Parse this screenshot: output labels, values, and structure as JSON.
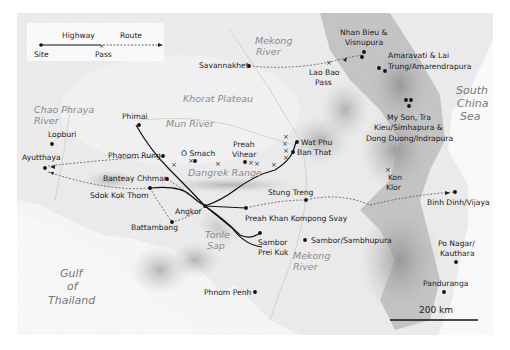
{
  "legend": {
    "highway_label": "Highway",
    "route_label": "Route",
    "site_label": "Site",
    "pass_label": "Pass"
  },
  "sites": [
    {
      "name": "Phimai",
      "x": 136,
      "y": 125
    },
    {
      "name": "Lopburi",
      "x": 52,
      "y": 144
    },
    {
      "name": "Ayutthaya",
      "x": 45,
      "y": 168
    },
    {
      "name": "Phanom Rung",
      "x": 163,
      "y": 156
    },
    {
      "name": "O Smach",
      "x": 195,
      "y": 161
    },
    {
      "name": "Preah Vihear",
      "x": 245,
      "y": 162
    },
    {
      "name": "Wat Phu",
      "x": 296,
      "y": 142
    },
    {
      "name": "Ban That",
      "x": 293,
      "y": 152
    },
    {
      "name": "Banteay Chhmar",
      "x": 167,
      "y": 179
    },
    {
      "name": "Sdok Kok Thom",
      "x": 150,
      "y": 188
    },
    {
      "name": "Battambang",
      "x": 172,
      "y": 222
    },
    {
      "name": "Angkor",
      "x": 205,
      "y": 206
    },
    {
      "name": "Preah Khan Kompong Svay",
      "x": 246,
      "y": 208
    },
    {
      "name": "Stung Treng",
      "x": 306,
      "y": 200
    },
    {
      "name": "Sambor Prei Kuk",
      "x": 260,
      "y": 233
    },
    {
      "name": "Sambor/Sambhupura",
      "x": 305,
      "y": 240
    },
    {
      "name": "Phnom Penh",
      "x": 255,
      "y": 292
    },
    {
      "name": "Savannakhet",
      "x": 249,
      "y": 66
    },
    {
      "name": "Nhan Bieu & Visnupura",
      "x": 364,
      "y": 52
    },
    {
      "name": "Amaravati & Lai Trung/Amarendrapura",
      "x": 383,
      "y": 70
    },
    {
      "name": "My Son, Tra Kieu/Simhapura & Dong Duong/Indrapura",
      "x": 408,
      "y": 103
    },
    {
      "name": "Binh Dinh/Vijaya",
      "x": 455,
      "y": 192
    },
    {
      "name": "Po Nagar/ Kauthara",
      "x": 456,
      "y": 262
    },
    {
      "name": "Panduranga",
      "x": 444,
      "y": 292
    }
  ],
  "labels": {
    "phimai": "Phimai",
    "lopburi": "Lopburi",
    "ayutthaya": "Ayutthaya",
    "phanom_rung": "Phanom Rung",
    "o_smach": "O Smach",
    "preah_vihear_1": "Preah",
    "preah_vihear_2": "Vihear",
    "wat_phu": "Wat Phu",
    "ban_that": "Ban That",
    "banteay_chhmar": "Banteay Chhmar",
    "sdok_kok_thom": "Sdok Kok Thom",
    "battambang": "Battambang",
    "angkor": "Angkor",
    "preah_khan": "Preah Khan Kompong Svay",
    "stung_treng": "Stung Treng",
    "sambor_prei_kuk_1": "Sambor",
    "sambor_prei_kuk_2": "Prei Kuk",
    "sambor_sambhupura": "Sambor/Sambhupura",
    "phnom_penh": "Phnom Penh",
    "savannakhet": "Savannakhet",
    "lao_bao_1": "Lao Bao",
    "lao_bao_2": "Pass",
    "nhan_bieu_1": "Nhan Bieu &",
    "nhan_bieu_2": "Visnupura",
    "amaravati_1": "Amaravati & Lai",
    "amaravati_2": "Trung/Amarendrapura",
    "myson_1": "My Son, Tra",
    "myson_2": "Kieu/Simhapura &",
    "myson_3": "Dong Duong/Indrapura",
    "kon_klor_1": "Kon",
    "kon_klor_2": "Klor",
    "binh_dinh": "Binh Dinh/Vijaya",
    "po_nagar_1": "Po Nagar/",
    "po_nagar_2": "Kauthara",
    "panduranga": "Panduranga"
  },
  "geography": {
    "mekong_north_1": "Mekong",
    "mekong_north_2": "River",
    "khorat": "Khorat Plateau",
    "mun_river": "Mun River",
    "chao_phraya_1": "Chao Phraya",
    "chao_phraya_2": "River",
    "dangrek": "Dangrek Range",
    "tonle_sap_1": "Tonle",
    "tonle_sap_2": "Sap",
    "mekong_south_1": "Mekong",
    "mekong_south_2": "River",
    "gulf_1": "Gulf",
    "gulf_2": "of",
    "gulf_3": "Thailand",
    "south_china_sea_1": "South",
    "south_china_sea_2": "China",
    "south_china_sea_3": "Sea"
  },
  "scale_bar": {
    "label": "200 km"
  },
  "colors": {
    "land_light": "#efefef",
    "land_mid": "#d6d6d6",
    "mountain": "#a9a9a9",
    "sea": "#fafafa",
    "highway": "#111111",
    "route": "#555555"
  }
}
